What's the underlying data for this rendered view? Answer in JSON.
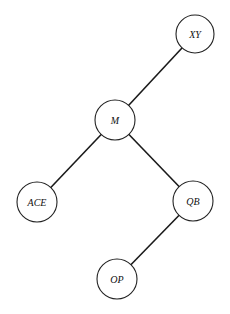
{
  "diagram": {
    "type": "tree",
    "colors": {
      "background": "#ffffff",
      "edge": "#1a1a1a",
      "node_stroke": "#222222",
      "node_fill": "#ffffff",
      "label": "#111111"
    },
    "nodes": [
      {
        "id": "XY",
        "label": "XY",
        "cx": 195,
        "cy": 34,
        "r": 19
      },
      {
        "id": "M",
        "label": "M",
        "cx": 115,
        "cy": 120,
        "r": 20
      },
      {
        "id": "ACE",
        "label": "ACE",
        "cx": 37,
        "cy": 202,
        "r": 20
      },
      {
        "id": "QB",
        "label": "QB",
        "cx": 193,
        "cy": 201,
        "r": 20
      },
      {
        "id": "OP",
        "label": "OP",
        "cx": 117,
        "cy": 279,
        "r": 20
      }
    ],
    "edges": [
      {
        "from": "XY",
        "to": "M"
      },
      {
        "from": "M",
        "to": "ACE"
      },
      {
        "from": "M",
        "to": "QB"
      },
      {
        "from": "QB",
        "to": "OP"
      }
    ]
  }
}
